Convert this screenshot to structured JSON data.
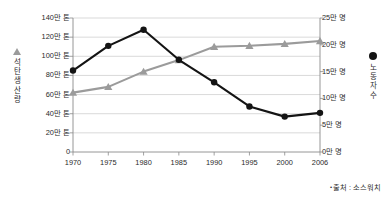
{
  "chart_data": {
    "type": "line",
    "title": "",
    "subtitle": "",
    "xlabel": "",
    "grid": true,
    "legend_position": "axis-titles",
    "categories": [
      "1970",
      "1975",
      "1980",
      "1985",
      "1990",
      "1995",
      "2000",
      "2006"
    ],
    "x": [
      1970,
      1975,
      1980,
      1985,
      1990,
      1995,
      2000,
      2006
    ],
    "axes": {
      "left": {
        "label": "석탄 생산량",
        "unit": "만 톤",
        "ylim": [
          0,
          140
        ],
        "ticks": [
          0,
          20,
          40,
          60,
          80,
          100,
          120,
          140
        ],
        "tick_labels": [
          "0",
          "20만 톤",
          "40만 톤",
          "60만 톤",
          "80만 톤",
          "100만 톤",
          "120만 톤",
          "140만 톤"
        ],
        "marker": "triangle",
        "color": "#9b9b9b"
      },
      "right": {
        "label": "노동자 수",
        "unit": "만 명",
        "ylim": [
          0,
          25
        ],
        "ticks": [
          0,
          5,
          10,
          15,
          20,
          25
        ],
        "tick_labels": [
          "0만 명",
          "5만 명",
          "10만 명",
          "15만 명",
          "20만 명",
          "25만 명"
        ],
        "marker": "circle",
        "color": "#141414"
      }
    },
    "series": [
      {
        "name": "석탄 생산량",
        "axis": "left",
        "unit": "만 톤",
        "marker": "triangle",
        "color": "#9b9b9b",
        "values": [
          62,
          68,
          84,
          96,
          110,
          111,
          113,
          116
        ]
      },
      {
        "name": "노동자 수",
        "axis": "right",
        "unit": "만 명",
        "marker": "circle",
        "color": "#141414",
        "values": [
          15.2,
          19.8,
          22.8,
          17.2,
          13.0,
          8.5,
          6.6,
          7.3
        ]
      }
    ]
  },
  "left_axis_title_chars": [
    "석",
    "탄",
    "생",
    "산",
    "량"
  ],
  "right_axis_title_chars": [
    "노",
    "동",
    "자",
    "수"
  ],
  "source": {
    "bullet": "•",
    "text": "출처 : 소스워치"
  }
}
